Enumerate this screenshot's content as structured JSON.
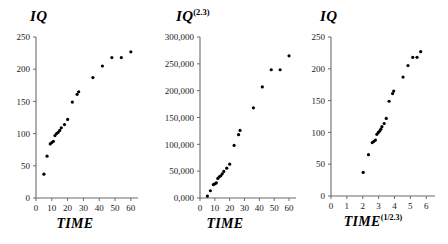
{
  "figure": {
    "background": "#ffffff",
    "point_color": "#000000",
    "axis_color": "#6b6b6b",
    "width": 448,
    "height": 244
  },
  "chart_data": [
    {
      "type": "scatter",
      "title": "IQ",
      "title_sup": "",
      "xlabel": "TIME",
      "xlabel_sup": "",
      "ylabel": "IQ",
      "xlim": [
        0,
        62
      ],
      "ylim": [
        0,
        250
      ],
      "xticks": [
        0,
        10,
        20,
        30,
        40,
        50,
        60
      ],
      "xticklabels": [
        "0",
        "10",
        "20",
        "30",
        "40",
        "50",
        "60"
      ],
      "yticks": [
        0,
        50,
        100,
        150,
        200,
        250
      ],
      "yticklabels": [
        "0",
        "50",
        "100",
        "150",
        "200",
        "250"
      ],
      "grid": false,
      "legend": null,
      "x": [
        5,
        7,
        9,
        10,
        11,
        12,
        13,
        14,
        15,
        16,
        18,
        20,
        23,
        26,
        27,
        36,
        42,
        48,
        54,
        60
      ],
      "y": [
        37,
        65,
        84,
        86,
        88,
        97,
        100,
        102,
        105,
        109,
        114,
        122,
        149,
        161,
        165,
        187,
        205,
        218,
        218,
        227
      ]
    },
    {
      "type": "scatter",
      "title": "IQ",
      "title_sup": "(2.3)",
      "xlabel": "TIME",
      "xlabel_sup": "",
      "ylabel": "IQ^(2.3)",
      "xlim": [
        0,
        62
      ],
      "ylim": [
        0,
        300000
      ],
      "xticks": [
        0,
        10,
        20,
        30,
        40,
        50,
        60
      ],
      "xticklabels": [
        "0",
        "10",
        "20",
        "30",
        "40",
        "50",
        "60"
      ],
      "yticks": [
        0,
        50000,
        100000,
        150000,
        200000,
        250000,
        300000
      ],
      "yticklabels": [
        "0,000",
        "50,000",
        "100,000",
        "150,000",
        "200,000",
        "250,000",
        "300,000"
      ],
      "grid": false,
      "legend": null,
      "x": [
        5,
        7,
        9,
        10,
        11,
        12,
        13,
        14,
        15,
        16,
        18,
        20,
        23,
        26,
        27,
        36,
        42,
        48,
        54,
        60
      ],
      "y": [
        3500,
        13500,
        25000,
        26500,
        28000,
        36500,
        39500,
        41500,
        45000,
        49500,
        55500,
        63000,
        98000,
        118000,
        126000,
        168000,
        207000,
        239000,
        239000,
        265000
      ]
    },
    {
      "type": "scatter",
      "title": "IQ",
      "title_sup": "",
      "xlabel": "TIME",
      "xlabel_sup": "(1/2.3)",
      "ylabel": "IQ",
      "xlim": [
        0,
        6.3
      ],
      "ylim": [
        0,
        250
      ],
      "xticks": [
        0,
        1,
        2,
        3,
        4,
        5,
        6
      ],
      "xticklabels": [
        "0",
        "1",
        "2",
        "3",
        "4",
        "5",
        "6"
      ],
      "yticks": [
        0,
        50,
        100,
        150,
        200,
        250
      ],
      "yticklabels": [
        "0",
        "50",
        "100",
        "150",
        "200",
        "250"
      ],
      "grid": false,
      "legend": null,
      "x": [
        2.03,
        2.36,
        2.6,
        2.7,
        2.8,
        2.89,
        2.98,
        3.06,
        3.14,
        3.21,
        3.35,
        3.48,
        3.66,
        3.88,
        3.95,
        4.54,
        4.85,
        5.15,
        5.42,
        5.65
      ],
      "y": [
        37,
        65,
        84,
        86,
        88,
        97,
        100,
        102,
        105,
        109,
        114,
        122,
        149,
        161,
        165,
        187,
        205,
        218,
        218,
        227
      ]
    }
  ]
}
